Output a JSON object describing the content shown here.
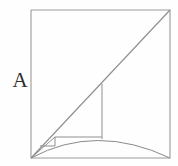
{
  "figure": {
    "labels": {
      "region_a": "A"
    },
    "colors": {
      "background": "#fefefe",
      "outline": "#9a9a9a",
      "diagonal": "#8d8d8d",
      "curve": "#8a8a8a",
      "rectangle": "#8f8f8f",
      "label_text": "#2e2e2e"
    },
    "stroke_widths": {
      "square": 1.1,
      "diagonal": 1.1,
      "curve": 1.0,
      "rectangle": 1.0
    }
  },
  "chart_data": {
    "type": "line",
    "xlabel": "",
    "ylabel": "",
    "xlim": [
      31,
      170
    ],
    "ylim": [
      158,
      10
    ],
    "grid": false,
    "legend": null,
    "annotations": [
      {
        "text": "A",
        "x": 19,
        "y": 82,
        "role": "region-label"
      }
    ],
    "series": [
      {
        "name": "square-outline",
        "kind": "polygon",
        "points": [
          [
            31,
            10
          ],
          [
            170,
            10
          ],
          [
            170,
            158
          ],
          [
            31,
            158
          ],
          [
            31,
            10
          ]
        ]
      },
      {
        "name": "diagonal",
        "kind": "segment",
        "points": [
          [
            31,
            158
          ],
          [
            170,
            10
          ]
        ]
      },
      {
        "name": "arc-curve",
        "kind": "quadratic-bezier",
        "points": [
          [
            31,
            158
          ],
          [
            170,
            158
          ]
        ],
        "control": [
          96,
          123
        ]
      },
      {
        "name": "large-rectangle",
        "kind": "polyline",
        "points": [
          [
            55,
            137
          ],
          [
            102,
            137
          ],
          [
            102,
            84
          ]
        ]
      },
      {
        "name": "large-rectangle-vertical-drop",
        "kind": "segment",
        "points": [
          [
            102,
            137
          ],
          [
            102,
            139
          ]
        ]
      },
      {
        "name": "small-rectangle",
        "kind": "polyline",
        "points": [
          [
            40,
            146
          ],
          [
            55,
            146
          ],
          [
            55,
            137
          ]
        ]
      },
      {
        "name": "small-rectangle-base",
        "kind": "segment",
        "points": [
          [
            31,
            158
          ],
          [
            55,
            137
          ]
        ]
      }
    ]
  }
}
